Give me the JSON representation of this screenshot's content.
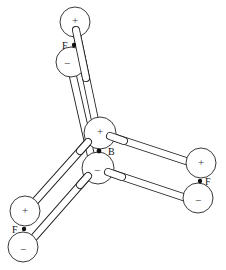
{
  "diagram": {
    "central_atom": {
      "label": "B",
      "upper_lobe_sign": "+",
      "lower_lobe_sign": "−",
      "nucleus": [
        99,
        151
      ],
      "upper_lobe": [
        100,
        133
      ],
      "lower_lobe": [
        98,
        168
      ]
    },
    "outer_atoms": [
      {
        "id": "top",
        "label": "F",
        "upper_lobe_sign": "+",
        "lower_lobe_sign": "−",
        "nucleus": [
          74,
          45
        ],
        "upper_lobe": [
          75,
          22
        ],
        "lower_lobe": [
          71,
          62
        ]
      },
      {
        "id": "right",
        "label": "F",
        "upper_lobe_sign": "+",
        "lower_lobe_sign": "−",
        "nucleus": [
          200,
          181
        ],
        "upper_lobe": [
          201,
          163
        ],
        "lower_lobe": [
          198,
          198
        ]
      },
      {
        "id": "lower-left",
        "label": "F",
        "upper_lobe_sign": "+",
        "lower_lobe_sign": "−",
        "nucleus": [
          24,
          229
        ],
        "upper_lobe": [
          25,
          211
        ],
        "lower_lobe": [
          23,
          247
        ]
      }
    ],
    "colors": {
      "line": "#222222",
      "background": "#ffffff"
    }
  }
}
